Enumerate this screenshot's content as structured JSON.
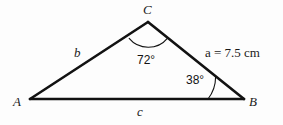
{
  "figure": {
    "stroke_color": "#121212",
    "background_color": "#fdfdfd",
    "vertices": {
      "A": {
        "label": "A",
        "x": 30,
        "y": 99
      },
      "B": {
        "label": "B",
        "x": 244,
        "y": 99
      },
      "C": {
        "label": "C",
        "x": 148,
        "y": 22
      }
    },
    "sides": {
      "a": {
        "label": "a",
        "measure_text": "a = 7.5 cm",
        "value": "7.5",
        "unit": "cm",
        "equals": "=",
        "opposite_vertex": "A"
      },
      "b": {
        "label": "b",
        "measure_text": "b",
        "opposite_vertex": "B"
      },
      "c": {
        "label": "c",
        "measure_text": "c",
        "opposite_vertex": "C"
      }
    },
    "angles": {
      "C": {
        "label": "72°",
        "value": 72,
        "vertex": "C",
        "arc_radius": 25
      },
      "B": {
        "label": "38°",
        "value": 38,
        "vertex": "B",
        "arc_radius": 36
      }
    }
  }
}
